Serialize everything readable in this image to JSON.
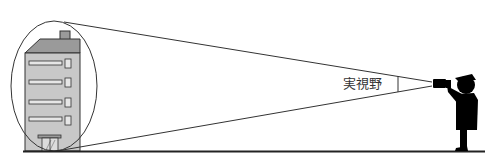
{
  "diagram": {
    "labels": {
      "field_of_view": "実視野"
    },
    "colors": {
      "building_fill": "#c8c8c8",
      "roof_fill": "#9a9a9a",
      "outline": "#333333",
      "silhouette": "#000000",
      "ground": "#222222",
      "background": "#ffffff"
    }
  }
}
